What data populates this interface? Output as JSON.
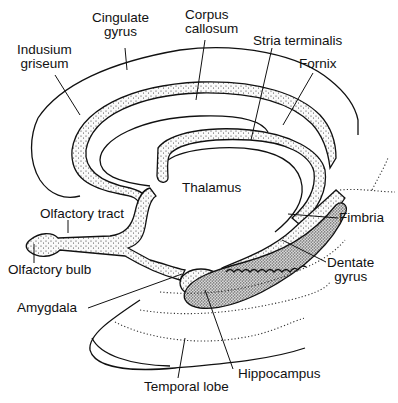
{
  "diagram": {
    "labels": {
      "cingulate_gyrus_1": "Cingulate",
      "cingulate_gyrus_2": "gyrus",
      "corpus_callosum_1": "Corpus",
      "corpus_callosum_2": "callosum",
      "indusium_griseum_1": "Indusium",
      "indusium_griseum_2": "griseum",
      "stria_terminalis": "Stria terminalis",
      "fornix": "Fornix",
      "thalamus": "Thalamus",
      "olfactory_tract": "Olfactory tract",
      "olfactory_bulb": "Olfactory bulb",
      "fimbria": "Fimbria",
      "dentate_gyrus_1": "Dentate",
      "dentate_gyrus_2": "gyrus",
      "amygdala": "Amygdala",
      "hippocampus": "Hippocampus",
      "temporal_lobe": "Temporal lobe"
    },
    "colors": {
      "ink": "#111111",
      "background": "#ffffff"
    }
  }
}
